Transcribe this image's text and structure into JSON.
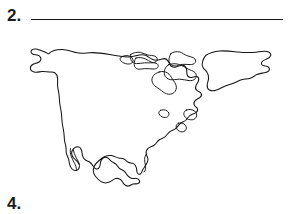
{
  "document": {
    "type": "worksheet-page",
    "background_color": "#ffffff",
    "ink_color": "#141414"
  },
  "items": [
    {
      "number": "2.",
      "answer_line": {
        "present": true,
        "value": "",
        "style": "solid-rule"
      }
    },
    {
      "number": "4.",
      "answer_line": {
        "present": false,
        "value": ""
      }
    }
  ],
  "figure": {
    "name": "north-america-outline-map",
    "kind": "line-drawing",
    "landmasses": [
      "North America mainland",
      "Greenland",
      "Canadian Arctic Archipelago",
      "Baja California peninsula",
      "Florida peninsula",
      "Central America isthmus",
      "Newfoundland",
      "Nova Scotia"
    ],
    "labels": [],
    "fill": "none",
    "stroke_color": "#141414"
  }
}
